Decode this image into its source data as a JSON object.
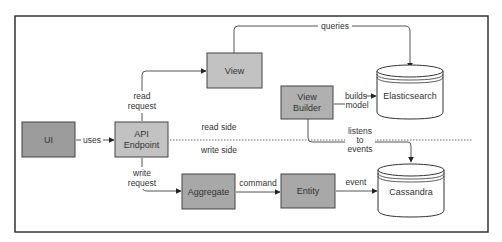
{
  "diagram": {
    "title": "",
    "colors": {
      "frame": "#333333",
      "box_fill_light": "#c2c2c2",
      "box_fill_dark": "#a8a8a8",
      "box_stroke": "#444444",
      "line": "#555555",
      "text": "#333333"
    },
    "nodes": {
      "ui": {
        "label": "UI"
      },
      "api": {
        "label_line1": "API",
        "label_line2": "Endpoint"
      },
      "view": {
        "label": "View"
      },
      "view_builder": {
        "label_line1": "View",
        "label_line2": "Builder"
      },
      "aggregate": {
        "label": "Aggregate"
      },
      "entity": {
        "label": "Entity"
      },
      "elasticsearch": {
        "label": "Elasticsearch",
        "shape": "database-cylinder"
      },
      "cassandra": {
        "label": "Cassandra",
        "shape": "database-cylinder"
      }
    },
    "edges": {
      "uses": {
        "label": "uses",
        "from": "UI",
        "to": "API Endpoint"
      },
      "read_request": {
        "label_line1": "read",
        "label_line2": "request",
        "from": "API Endpoint",
        "to": "View"
      },
      "queries": {
        "label": "queries",
        "from": "View",
        "to": "Elasticsearch"
      },
      "builds_model": {
        "label_line1": "builds",
        "label_line2": "model",
        "from": "View Builder",
        "to": "Elasticsearch"
      },
      "listens_to_events": {
        "label_line1": "listens",
        "label_line2": "to",
        "label_line3": "events",
        "from": "View Builder",
        "to": "Cassandra"
      },
      "write_request": {
        "label_line1": "write",
        "label_line2": "request",
        "from": "API Endpoint",
        "to": "Aggregate"
      },
      "command": {
        "label": "command",
        "from": "Aggregate",
        "to": "Entity"
      },
      "event": {
        "label": "event",
        "from": "Entity",
        "to": "Cassandra"
      }
    },
    "divider": {
      "read_side": "read side",
      "write_side": "write side",
      "style": "dotted"
    }
  }
}
